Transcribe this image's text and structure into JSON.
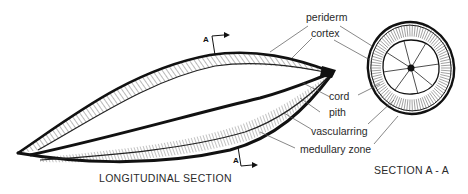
{
  "diagram": {
    "labels": {
      "periderm": "periderm",
      "cortex": "cortex",
      "cord": "cord",
      "pith": "pith",
      "vascular_ring": "vascularring",
      "medullary_zone": "medullary zone"
    },
    "section_marks": {
      "top": "A",
      "bottom": "A"
    },
    "captions": {
      "longitudinal": "LONGITUDINAL SECTION",
      "cross": "SECTION A - A"
    },
    "colors": {
      "ink": "#111111",
      "leader": "#555555",
      "text": "#2a2a2a",
      "background": "#ffffff"
    }
  }
}
